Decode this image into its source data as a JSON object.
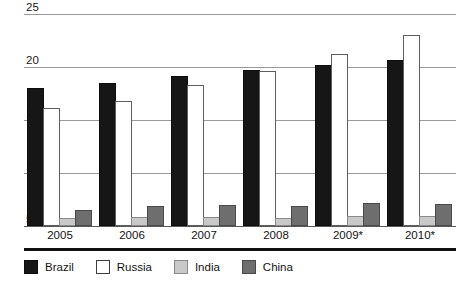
{
  "chart_data": {
    "type": "bar",
    "title": "",
    "subtitle": "",
    "xlabel": "",
    "ylabel": "",
    "categories": [
      "2005",
      "2006",
      "2007",
      "2008",
      "2009*",
      "2010*"
    ],
    "series": [
      {
        "name": "Brazil",
        "color": "#161616",
        "values": [
          17.8,
          18.3,
          19.0,
          19.5,
          20.0,
          20.5
        ]
      },
      {
        "name": "Russia",
        "color": "#ffffff",
        "values": [
          15.9,
          16.6,
          18.1,
          19.4,
          21.0,
          22.8
        ]
      },
      {
        "name": "India",
        "color": "#c9c9c9",
        "values": [
          5.6,
          5.7,
          5.7,
          5.6,
          5.8,
          5.8
        ]
      },
      {
        "name": "China",
        "color": "#6e6e6e",
        "values": [
          6.3,
          6.7,
          6.8,
          6.7,
          7.0,
          6.9
        ]
      }
    ],
    "ylim": [
      5,
      25
    ],
    "yticks": [
      5,
      10,
      15,
      20,
      25
    ],
    "ytick_labels": [
      "5",
      "10",
      "15",
      "20",
      "25"
    ],
    "grid": true,
    "legend_position": "bottom-left",
    "legend": [
      "Brazil",
      "Russia",
      "India",
      "China"
    ]
  },
  "axis": {
    "y_labels": [
      "25",
      "20",
      "15",
      "10",
      "5"
    ],
    "x_labels": [
      "2005",
      "2006",
      "2007",
      "2008",
      "2009*",
      "2010*"
    ]
  },
  "legend": {
    "items": [
      {
        "label": "Brazil"
      },
      {
        "label": "Russia"
      },
      {
        "label": "India"
      },
      {
        "label": "China"
      }
    ]
  }
}
